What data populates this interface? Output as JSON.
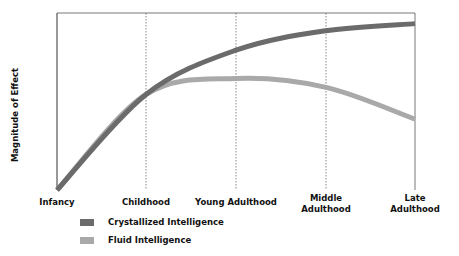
{
  "chart_data": {
    "type": "line",
    "title": "",
    "xlabel": "",
    "ylabel": "Magnitude of Effect",
    "categories": [
      "Infancy",
      "Childhood",
      "Young Adulthood",
      "Middle Adulthood",
      "Late Adulthood"
    ],
    "series": [
      {
        "name": "Crystallized Intelligence",
        "color": "#6b6b6b",
        "values": [
          0,
          54,
          79,
          90,
          94
        ]
      },
      {
        "name": "Fluid Intelligence",
        "color": "#a9a9a9",
        "values": [
          0,
          54,
          63,
          58,
          40
        ]
      }
    ],
    "ylim": [
      0,
      100
    ],
    "grid": "vertical dotted lines at each life stage",
    "legend_position": "bottom-left",
    "y_ticks_shown": false
  },
  "labels": {
    "ylabel": "Magnitude of Effect",
    "x": [
      {
        "line1": "Infancy",
        "line2": ""
      },
      {
        "line1": "Childhood",
        "line2": ""
      },
      {
        "line1": "Young Adulthood",
        "line2": ""
      },
      {
        "line1": "Middle",
        "line2": "Adulthood"
      },
      {
        "line1": "Late",
        "line2": "Adulthood"
      }
    ]
  },
  "legend": [
    {
      "label": "Crystallized Intelligence",
      "color": "#6b6b6b"
    },
    {
      "label": "Fluid Intelligence",
      "color": "#a9a9a9"
    }
  ]
}
